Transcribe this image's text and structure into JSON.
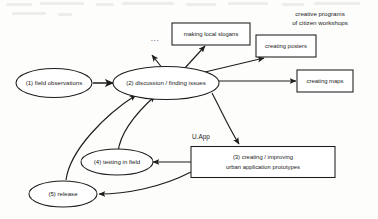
{
  "diagram": {
    "background_color": "#fdfdfb",
    "ink_color": "#1d1d1d"
  },
  "nodes": {
    "field_observations": {
      "label": "(1) field observations",
      "shape": "ellipse"
    },
    "discussion": {
      "label": "(2) discussion / finding issues",
      "shape": "ellipse"
    },
    "creating": {
      "label_line1": "(3) creating / improving",
      "label_line2": "urban application prototypes",
      "shape": "rectangle"
    },
    "testing": {
      "label": "(4) testing in field",
      "shape": "ellipse"
    },
    "release": {
      "label": "(5) release",
      "shape": "ellipse"
    }
  },
  "output_boxes": [
    {
      "label": "making local slogans"
    },
    {
      "label": "creating posters"
    },
    {
      "label": "creating maps"
    }
  ],
  "annotations": {
    "workshops_line1": "creative programs",
    "workshops_line2": "of citizen workshops",
    "uapp": "U.App",
    "ellipsis": "..."
  }
}
